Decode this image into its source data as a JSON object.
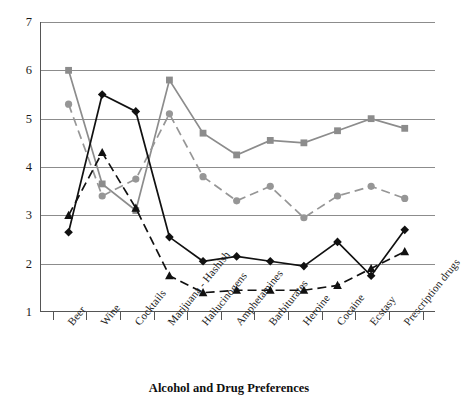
{
  "chart_data": {
    "type": "line",
    "title": "",
    "xlabel": "Alcohol and Drug Preferences",
    "ylabel": "",
    "ylim": [
      1,
      7
    ],
    "yticks": [
      1,
      2,
      3,
      4,
      5,
      6,
      7
    ],
    "ytick_labels": [
      "1",
      "2",
      "3",
      "4",
      "5",
      "6",
      "7"
    ],
    "grid": true,
    "legend": "none",
    "categories": [
      "Beer",
      "Wine",
      "Cocktails",
      "Marijuana - Hashish",
      "Hallucinogens",
      "Amphetamines",
      "Barbiturates",
      "Heroine",
      "Cocaine",
      "Ecstasy",
      "Prescription drugs"
    ],
    "series": [
      {
        "name": "gray-square-solid",
        "marker": "square",
        "line": "solid",
        "color": "#8c8c8c",
        "values": [
          6.0,
          3.65,
          3.1,
          5.8,
          4.7,
          4.25,
          4.55,
          4.5,
          4.75,
          5.0,
          4.8
        ]
      },
      {
        "name": "gray-circle-dashed",
        "marker": "circle",
        "line": "dashed",
        "color": "#969696",
        "values": [
          5.3,
          3.4,
          3.75,
          5.1,
          3.8,
          3.3,
          3.6,
          2.95,
          3.4,
          3.6,
          3.35
        ]
      },
      {
        "name": "black-diamond-solid",
        "marker": "diamond",
        "line": "solid",
        "color": "#111111",
        "values": [
          2.65,
          5.5,
          5.15,
          2.55,
          2.05,
          2.15,
          2.05,
          1.95,
          2.45,
          1.75,
          2.7
        ]
      },
      {
        "name": "black-triangle-dashed",
        "marker": "triangle",
        "line": "dashed",
        "color": "#111111",
        "values": [
          3.0,
          4.3,
          3.15,
          1.75,
          1.4,
          1.45,
          1.45,
          1.45,
          1.55,
          1.9,
          2.25
        ]
      }
    ]
  },
  "axis": {
    "x_title": "Alcohol and Drug Preferences"
  }
}
